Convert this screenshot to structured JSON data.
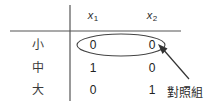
{
  "figure": {
    "type": "design-matrix-table",
    "colors": {
      "rule": "#555555",
      "text": "#2b2b2b",
      "ellipse": "#444444",
      "arrow": "#333333",
      "background": "#ffffff"
    },
    "columns": [
      {
        "label": "x",
        "subscript": "1"
      },
      {
        "label": "x",
        "subscript": "2"
      }
    ],
    "rows": [
      {
        "label": "小",
        "values": [
          "0",
          "0"
        ]
      },
      {
        "label": "中",
        "values": [
          "1",
          "0"
        ]
      },
      {
        "label": "大",
        "values": [
          "0",
          "1"
        ]
      }
    ],
    "annotation": {
      "text": "對照組",
      "points_to_row": "小"
    }
  }
}
